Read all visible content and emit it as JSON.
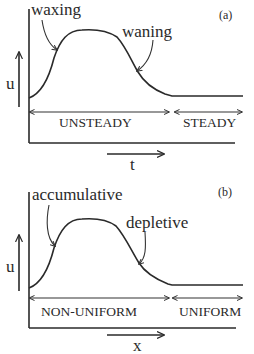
{
  "panels": [
    {
      "id": "a",
      "tag": "(a)",
      "y_label": "u",
      "x_label": "t",
      "annotations": {
        "rising": "waxing",
        "falling": "waning"
      },
      "regions": {
        "left": "UNSTEADY",
        "right": "STEADY"
      }
    },
    {
      "id": "b",
      "tag": "(b)",
      "y_label": "u",
      "x_label": "x",
      "annotations": {
        "rising": "accumulative",
        "falling": "depletive"
      },
      "regions": {
        "left": "NON-UNIFORM",
        "right": "UNIFORM"
      }
    }
  ],
  "colors": {
    "ink": "#2a2a2a",
    "background": "#ffffff"
  }
}
